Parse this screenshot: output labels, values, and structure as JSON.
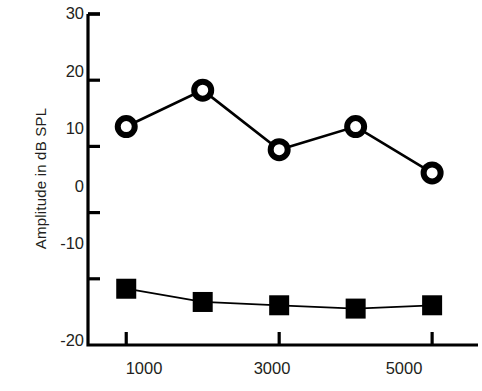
{
  "chart_data": {
    "type": "line",
    "title": "",
    "xlabel": "",
    "ylabel": "Amplitude in dB SPL",
    "x": [
      1000,
      2000,
      3000,
      4000,
      5000
    ],
    "xtick_labels": [
      "1000",
      "3000",
      "5000"
    ],
    "xticks": [
      1000,
      3000,
      5000
    ],
    "xlim": [
      500,
      5600
    ],
    "ylim": [
      -20,
      30
    ],
    "yticks": [
      30,
      20,
      10,
      0,
      -10,
      -20
    ],
    "ytick_labels": [
      "30",
      "20",
      "10",
      "0",
      "-10",
      "-20"
    ],
    "grid": false,
    "legend": "none",
    "series": [
      {
        "name": "open-circle-series",
        "marker": "open-circle",
        "color": "#000000",
        "values": [
          13.0,
          18.5,
          9.5,
          13.0,
          6.0
        ]
      },
      {
        "name": "filled-square-series",
        "marker": "filled-square",
        "color": "#000000",
        "values": [
          -11.5,
          -13.5,
          -14.0,
          -14.5,
          -14.0
        ]
      }
    ]
  },
  "axis": {
    "ylabel": "Amplitude in dB SPL",
    "ytick_labels": [
      "30",
      "20",
      "10",
      "0",
      "-10",
      "-20"
    ],
    "xtick_labels": [
      "1000",
      "3000",
      "5000"
    ]
  }
}
